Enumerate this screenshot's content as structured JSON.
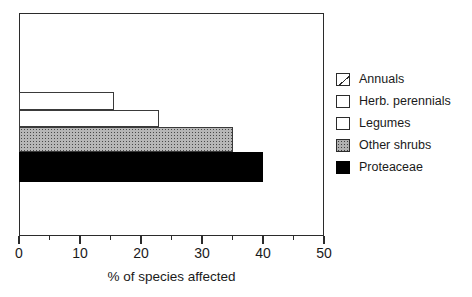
{
  "chart_data": {
    "type": "bar",
    "orientation": "horizontal",
    "title": "",
    "subtitle": "",
    "xlabel": "% of species affected",
    "ylabel": "",
    "xlim": [
      0,
      50
    ],
    "ylim": null,
    "grid": false,
    "legend_position": "right",
    "x_major_ticks": [
      0,
      10,
      20,
      30,
      40,
      50
    ],
    "x_major_tick_labels": [
      "0",
      "10",
      "20",
      "30",
      "40",
      "50"
    ],
    "x_minor_ticks": [
      5,
      15,
      25,
      35,
      45
    ],
    "categories": [
      "Annuals",
      "Herb. perennials",
      "Legumes",
      "Other shrubs",
      "Proteaceae"
    ],
    "values": [
      0,
      15.6,
      23,
      35,
      40
    ],
    "bar_styles": [
      "diagonal-hatch",
      "open",
      "open",
      "stipple-gray",
      "solid-black"
    ],
    "annotations": []
  },
  "axis": {
    "x_title": "% of species affected",
    "tick_labels": [
      {
        "value": 0,
        "text": "0"
      },
      {
        "value": 10,
        "text": "10"
      },
      {
        "value": 20,
        "text": "20"
      },
      {
        "value": 30,
        "text": "30"
      },
      {
        "value": 40,
        "text": "40"
      },
      {
        "value": 50,
        "text": "50"
      }
    ]
  },
  "legend": {
    "items": [
      {
        "label": "Annuals",
        "swatch": "diagonal-hatch-swatch",
        "color": "#ffffff"
      },
      {
        "label": "Herb. perennials",
        "swatch": "open-swatch",
        "color": "#ffffff"
      },
      {
        "label": "Legumes",
        "swatch": "open-swatch",
        "color": "#ffffff"
      },
      {
        "label": "Other shrubs",
        "swatch": "stipple-swatch",
        "color": "#b0b0b0"
      },
      {
        "label": "Proteaceae",
        "swatch": "solid-swatch",
        "color": "#000000"
      }
    ]
  },
  "colors": {
    "axis": "#2b2b2b",
    "text": "#1a1a1a",
    "background": "#ffffff",
    "solid_bar": "#000000",
    "stipple_bar": "#b0b0b0"
  }
}
